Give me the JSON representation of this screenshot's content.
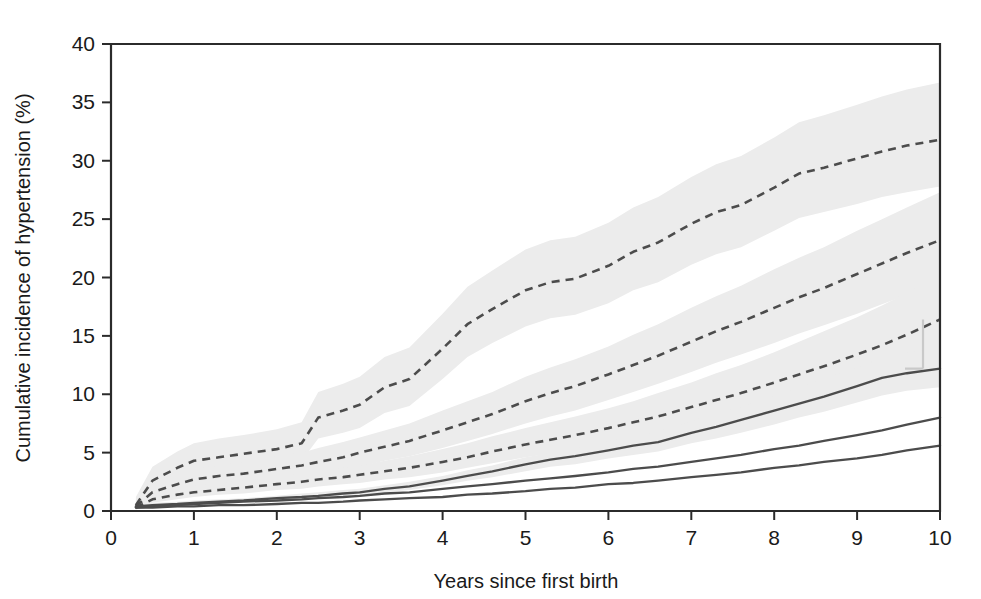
{
  "chart_data": {
    "type": "line",
    "title": "",
    "xlabel": "Years since first birth",
    "ylabel": "Cumulative incidence of hypertension (%)",
    "xlim": [
      0,
      10
    ],
    "ylim": [
      0,
      40
    ],
    "xticks": [
      "0",
      "1",
      "2",
      "3",
      "4",
      "5",
      "6",
      "7",
      "8",
      "9",
      "10"
    ],
    "yticks": [
      "0",
      "5",
      "10",
      "15",
      "20",
      "25",
      "30",
      "35",
      "40"
    ],
    "grid": false,
    "legend_position": "none",
    "colors": {
      "line": "#4c4c4c",
      "ci_band": "#ececec",
      "axis": "#2b2b2b",
      "background": "#ffffff"
    },
    "x": [
      0.3,
      0.5,
      0.8,
      1.0,
      1.3,
      1.6,
      2.0,
      2.3,
      2.5,
      2.8,
      3.0,
      3.3,
      3.6,
      4.0,
      4.3,
      4.6,
      5.0,
      5.3,
      5.6,
      6.0,
      6.3,
      6.6,
      7.0,
      7.3,
      7.6,
      8.0,
      8.3,
      8.6,
      9.0,
      9.3,
      9.6,
      10.0
    ],
    "series": [
      {
        "name": "curve-1-dashed",
        "style": "dashed",
        "has_ci_band": true,
        "values": [
          0.5,
          2.6,
          3.7,
          4.3,
          4.6,
          4.9,
          5.3,
          5.8,
          8.0,
          8.6,
          9.1,
          10.6,
          11.3,
          13.9,
          16.0,
          17.3,
          18.9,
          19.6,
          19.9,
          21.0,
          22.2,
          23.0,
          24.6,
          25.6,
          26.2,
          27.7,
          28.9,
          29.4,
          30.2,
          30.8,
          31.3,
          31.8
        ],
        "ci_lower": [
          0.2,
          1.7,
          2.6,
          3.1,
          3.4,
          3.6,
          4.0,
          4.3,
          6.2,
          6.7,
          7.1,
          8.4,
          9.0,
          11.3,
          13.2,
          14.4,
          15.8,
          16.5,
          16.8,
          17.8,
          18.9,
          19.6,
          21.1,
          22.0,
          22.6,
          24.0,
          25.1,
          25.6,
          26.3,
          26.9,
          27.3,
          27.8
        ],
        "ci_upper": [
          1.2,
          3.8,
          5.1,
          5.8,
          6.2,
          6.5,
          7.0,
          7.6,
          10.2,
          10.9,
          11.5,
          13.2,
          14.0,
          16.9,
          19.2,
          20.6,
          22.4,
          23.2,
          23.5,
          24.7,
          26.0,
          26.9,
          28.6,
          29.7,
          30.4,
          32.0,
          33.3,
          33.9,
          34.8,
          35.5,
          36.1,
          36.7
        ]
      },
      {
        "name": "curve-2-dashed",
        "style": "dashed",
        "has_ci_band": true,
        "values": [
          0.4,
          1.6,
          2.3,
          2.7,
          3.0,
          3.2,
          3.6,
          3.9,
          4.2,
          4.6,
          5.0,
          5.5,
          6.0,
          6.9,
          7.6,
          8.3,
          9.4,
          10.1,
          10.7,
          11.7,
          12.5,
          13.3,
          14.5,
          15.4,
          16.2,
          17.4,
          18.3,
          19.1,
          20.3,
          21.2,
          22.1,
          23.2
        ],
        "ci_lower": [
          0.2,
          1.1,
          1.7,
          2.0,
          2.2,
          2.4,
          2.7,
          3.0,
          3.2,
          3.5,
          3.8,
          4.3,
          4.7,
          5.4,
          6.0,
          6.6,
          7.5,
          8.1,
          8.6,
          9.5,
          10.2,
          10.9,
          11.9,
          12.7,
          13.4,
          14.4,
          15.2,
          15.9,
          16.9,
          17.7,
          18.5,
          19.4
        ],
        "ci_upper": [
          0.8,
          2.3,
          3.1,
          3.6,
          3.9,
          4.2,
          4.7,
          5.0,
          5.4,
          5.9,
          6.3,
          6.9,
          7.5,
          8.6,
          9.4,
          10.2,
          11.5,
          12.3,
          13.0,
          14.1,
          15.1,
          16.0,
          17.4,
          18.4,
          19.3,
          20.7,
          21.7,
          22.6,
          24.0,
          25.0,
          26.0,
          27.3
        ]
      },
      {
        "name": "curve-3-dashed",
        "style": "dashed",
        "has_ci_band": true,
        "values": [
          0.3,
          1.0,
          1.4,
          1.6,
          1.8,
          2.0,
          2.3,
          2.5,
          2.7,
          2.9,
          3.1,
          3.4,
          3.7,
          4.2,
          4.6,
          5.1,
          5.7,
          6.1,
          6.5,
          7.1,
          7.6,
          8.1,
          8.9,
          9.5,
          10.1,
          11.0,
          11.7,
          12.4,
          13.4,
          14.2,
          15.1,
          16.4
        ],
        "ci_lower": [
          0.1,
          0.7,
          1.0,
          1.2,
          1.4,
          1.5,
          1.8,
          1.9,
          2.1,
          2.3,
          2.4,
          2.7,
          2.9,
          3.3,
          3.7,
          4.1,
          4.6,
          4.9,
          5.2,
          5.7,
          6.1,
          6.5,
          7.2,
          7.7,
          8.2,
          8.9,
          9.5,
          10.1,
          10.9,
          11.6,
          12.3,
          13.3
        ],
        "ci_upper": [
          0.6,
          1.4,
          1.9,
          2.2,
          2.4,
          2.6,
          2.9,
          3.2,
          3.4,
          3.7,
          3.9,
          4.3,
          4.7,
          5.3,
          5.8,
          6.4,
          7.1,
          7.6,
          8.1,
          8.8,
          9.4,
          10.1,
          11.0,
          11.8,
          12.5,
          13.6,
          14.5,
          15.4,
          16.6,
          17.6,
          18.7,
          20.2
        ]
      },
      {
        "name": "curve-4-solid",
        "style": "solid",
        "has_ci_band": true,
        "values": [
          0.4,
          0.5,
          0.6,
          0.7,
          0.8,
          0.9,
          1.1,
          1.2,
          1.3,
          1.5,
          1.6,
          1.9,
          2.1,
          2.6,
          3.0,
          3.4,
          4.0,
          4.4,
          4.7,
          5.2,
          5.6,
          5.9,
          6.7,
          7.2,
          7.8,
          8.6,
          9.2,
          9.8,
          10.7,
          11.4,
          11.8,
          12.2
        ],
        "ci_lower": [
          0.3,
          0.4,
          0.5,
          0.6,
          0.7,
          0.8,
          0.9,
          1.0,
          1.1,
          1.3,
          1.4,
          1.6,
          1.8,
          2.2,
          2.6,
          2.9,
          3.4,
          3.8,
          4.0,
          4.5,
          4.8,
          5.1,
          5.8,
          6.2,
          6.7,
          7.4,
          8.0,
          8.5,
          9.3,
          9.9,
          10.3,
          10.6
        ],
        "ci_upper": [
          0.6,
          0.7,
          0.8,
          0.9,
          1.0,
          1.1,
          1.3,
          1.5,
          1.6,
          1.8,
          1.9,
          2.2,
          2.5,
          3.0,
          3.5,
          3.9,
          4.6,
          5.0,
          5.4,
          6.0,
          6.4,
          6.8,
          7.7,
          8.3,
          8.9,
          9.9,
          10.6,
          11.3,
          12.3,
          13.1,
          13.6,
          14.0
        ]
      },
      {
        "name": "curve-5-solid",
        "style": "solid",
        "has_ci_band": false,
        "values": [
          0.3,
          0.4,
          0.5,
          0.6,
          0.7,
          0.8,
          0.9,
          1.0,
          1.1,
          1.2,
          1.3,
          1.5,
          1.6,
          1.9,
          2.1,
          2.3,
          2.6,
          2.8,
          3.0,
          3.3,
          3.6,
          3.8,
          4.2,
          4.5,
          4.8,
          5.3,
          5.6,
          6.0,
          6.5,
          6.9,
          7.4,
          8.0
        ]
      },
      {
        "name": "curve-6-solid",
        "style": "solid",
        "has_ci_band": false,
        "values": [
          0.3,
          0.3,
          0.4,
          0.4,
          0.5,
          0.5,
          0.6,
          0.7,
          0.7,
          0.8,
          0.9,
          1.0,
          1.1,
          1.2,
          1.4,
          1.5,
          1.7,
          1.9,
          2.0,
          2.3,
          2.4,
          2.6,
          2.9,
          3.1,
          3.3,
          3.7,
          3.9,
          4.2,
          4.5,
          4.8,
          5.2,
          5.6
        ]
      }
    ],
    "annotations": [
      {
        "name": "ci-bar-right-edge",
        "x": 10.0,
        "low": 12.2,
        "high": 16.4
      }
    ]
  }
}
